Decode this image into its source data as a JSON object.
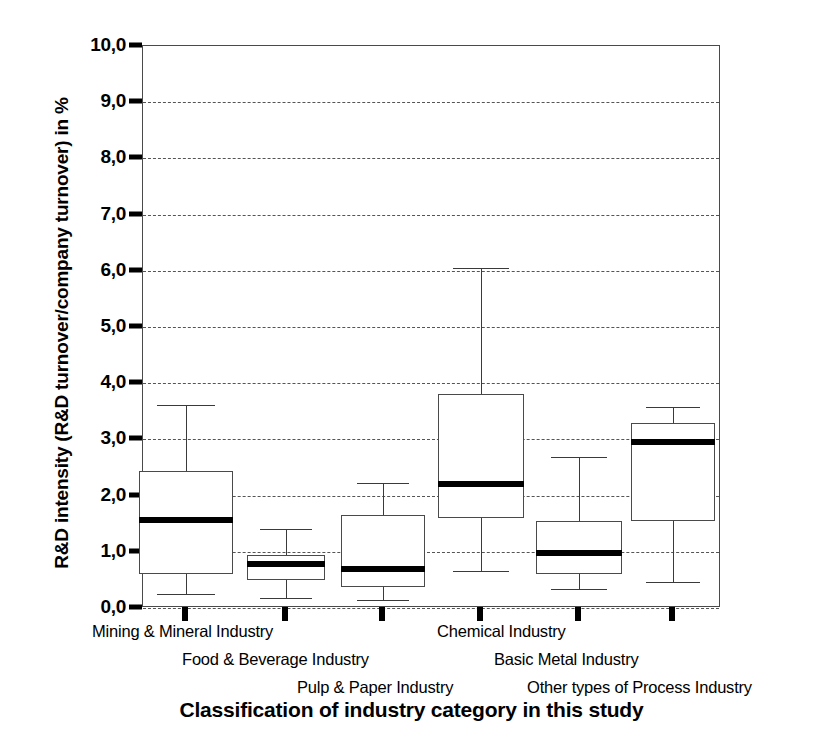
{
  "chart_data": {
    "type": "box",
    "title": "",
    "xlabel": "Classification of industry category in this study",
    "ylabel": "R&D intensity (R&D turnover/company turnover) in %",
    "ylim": [
      0.0,
      10.0
    ],
    "ytick_labels": [
      "0,0",
      "1,0",
      "2,0",
      "3,0",
      "4,0",
      "5,0",
      "6,0",
      "7,0",
      "8,0",
      "9,0",
      "10,0"
    ],
    "ytick_values": [
      0,
      1,
      2,
      3,
      4,
      5,
      6,
      7,
      8,
      9,
      10
    ],
    "grid": "horizontal-dashed",
    "decimal_separator": ",",
    "legend": "none",
    "categories": [
      "Mining & Mineral Industry",
      "Food & Beverage Industry",
      "Pulp & Paper Industry",
      "Chemical Industry",
      "Basic Metal Industry",
      "Other types of Process Industry"
    ],
    "boxes": [
      {
        "category": "Mining & Mineral Industry",
        "whisker_low": 0.25,
        "q1": 0.6,
        "median": 1.57,
        "q3": 2.44,
        "whisker_high": 3.61
      },
      {
        "category": "Food & Beverage Industry",
        "whisker_low": 0.17,
        "q1": 0.5,
        "median": 0.78,
        "q3": 0.95,
        "whisker_high": 1.4
      },
      {
        "category": "Pulp & Paper Industry",
        "whisker_low": 0.15,
        "q1": 0.38,
        "median": 0.7,
        "q3": 1.65,
        "whisker_high": 2.23
      },
      {
        "category": "Chemical Industry",
        "whisker_low": 0.65,
        "q1": 1.6,
        "median": 2.21,
        "q3": 3.8,
        "whisker_high": 6.05
      },
      {
        "category": "Basic Metal Industry",
        "whisker_low": 0.33,
        "q1": 0.6,
        "median": 0.97,
        "q3": 1.55,
        "whisker_high": 2.68
      },
      {
        "category": "Other types of Process Industry",
        "whisker_low": 0.47,
        "q1": 1.55,
        "median": 2.95,
        "q3": 3.3,
        "whisker_high": 3.57
      }
    ]
  },
  "style": {
    "line_color": "#3a3a3a",
    "median_color": "#000000",
    "grid_color": "#555555",
    "background": "#ffffff"
  }
}
